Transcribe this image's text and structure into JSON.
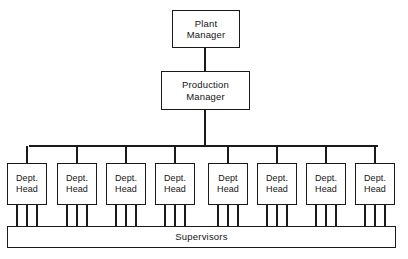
{
  "diagram": {
    "type": "org-chart",
    "colors": {
      "background": "#ffffff",
      "stroke": "#1a1a1a",
      "text": "#141414"
    },
    "nodes": {
      "plant_manager": {
        "line1": "Plant",
        "line2": "Manager",
        "x": 172,
        "y": 10,
        "w": 68,
        "h": 38
      },
      "production_manager": {
        "line1": "Production",
        "line2": "Manager",
        "x": 161,
        "y": 71,
        "w": 89,
        "h": 39
      },
      "supervisors": {
        "label": "Supervisors",
        "x": 7,
        "y": 226,
        "w": 389,
        "h": 22
      }
    },
    "department_heads": [
      {
        "line1": "Dept.",
        "line2": "Head",
        "x": 7,
        "y": 163,
        "w": 40,
        "h": 42
      },
      {
        "line1": "Dept.",
        "line2": "Head",
        "x": 57,
        "y": 163,
        "w": 40,
        "h": 42
      },
      {
        "line1": "Dept.",
        "line2": "Head",
        "x": 106,
        "y": 163,
        "w": 40,
        "h": 42
      },
      {
        "line1": "Dept.",
        "line2": "Head",
        "x": 155,
        "y": 163,
        "w": 40,
        "h": 42
      },
      {
        "line1": "Dept",
        "line2": "Head",
        "x": 208,
        "y": 163,
        "w": 40,
        "h": 42
      },
      {
        "line1": "Dept.",
        "line2": "Head",
        "x": 257,
        "y": 163,
        "w": 40,
        "h": 42
      },
      {
        "line1": "Dept.",
        "line2": "Head",
        "x": 306,
        "y": 163,
        "w": 40,
        "h": 42
      },
      {
        "line1": "Dept.",
        "line2": "Head",
        "x": 355,
        "y": 163,
        "w": 40,
        "h": 42
      }
    ],
    "connectors": {
      "plant_to_production_x": 205,
      "plant_to_production_y1": 48,
      "plant_to_production_y2": 71,
      "production_to_bus_x": 205,
      "production_to_bus_y1": 110,
      "production_to_bus_y2": 146,
      "bus_y": 146,
      "bus_x_left": 29,
      "bus_x_right": 378,
      "drop_y_end": 163,
      "supervisor_leg_y1": 205,
      "supervisor_leg_y2": 226,
      "legs_per_dept": 3
    }
  }
}
